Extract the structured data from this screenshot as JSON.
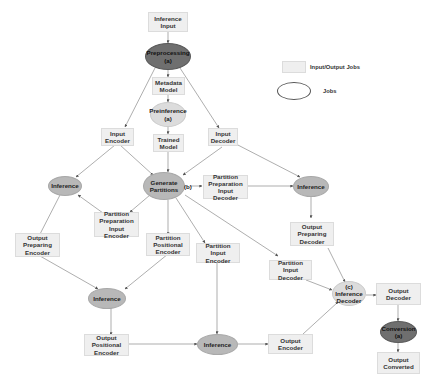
{
  "legend": {
    "io_label": "Input/Output Jobs",
    "jobs_label": "Jobs"
  },
  "nodes": {
    "inference_input": "Inference\nInput",
    "preprocessing": "Preprocessing\n(a)",
    "metadata_model": "Metadata\nModel",
    "preinference": "Preinference\n(a)",
    "trained_model": "Trained\nModel",
    "input_encoder": "Input\nEncoder",
    "input_decoder": "Input\nDecoder",
    "inference_left": "Inference",
    "generate_partitions": "Generate\nPartitions",
    "generate_partitions_tag": "(b)",
    "partition_prep_input_decoder": "Partition\nPreparation\nInput Decoder",
    "inference_right": "Inference",
    "partition_prep_input_encoder": "Partition\nPreparation\nInput Encoder",
    "output_preparing_encoder": "Output\nPreparing\nEncoder",
    "partition_positional_encoder": "Partition\nPositional\nEncoder",
    "partition_input_encoder": "Partition Input\nEncoder",
    "output_preparing_decoder": "Output\nPreparing\nDecoder",
    "partition_input_decoder": "Partition Input\nDecoder",
    "inference_decoder": "(c)\nInference\nDecoder",
    "output_decoder": "Output\nDecoder",
    "inference_mid": "Inference",
    "output_positional_encoder": "Output\nPositional\nEncoder",
    "inference_bottom": "Inference",
    "output_encoder": "Output\nEncoder",
    "conversion": "Conversion\n(a)",
    "output_converted": "Output\nConverted"
  },
  "colors": {
    "io_box": "#efefef",
    "job": "#b8b8b8",
    "job_dark": "#6f6f6f",
    "job_light": "#dcdcdc",
    "edge": "#666666"
  }
}
